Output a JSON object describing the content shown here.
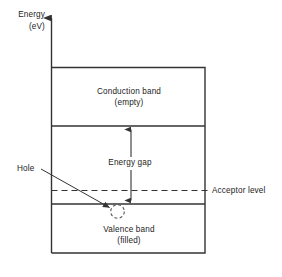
{
  "figure": {
    "type": "energy-band-diagram",
    "width": 282,
    "height": 277,
    "background_color": "#ffffff",
    "line_color": "#333333",
    "text_color": "#1c1c1c"
  },
  "axis": {
    "title_line1": "Energy",
    "title_line2": "(eV)",
    "orientation": "vertical",
    "arrow": "up"
  },
  "bands": {
    "conduction": {
      "name_line1": "Conduction band",
      "name_line2": "(empty)"
    },
    "valence": {
      "name_line1": "Valence band",
      "name_line2": "(filled)"
    }
  },
  "annotations": {
    "energy_gap": "Energy gap",
    "acceptor_level": "Acceptor level",
    "hole": "Hole"
  }
}
